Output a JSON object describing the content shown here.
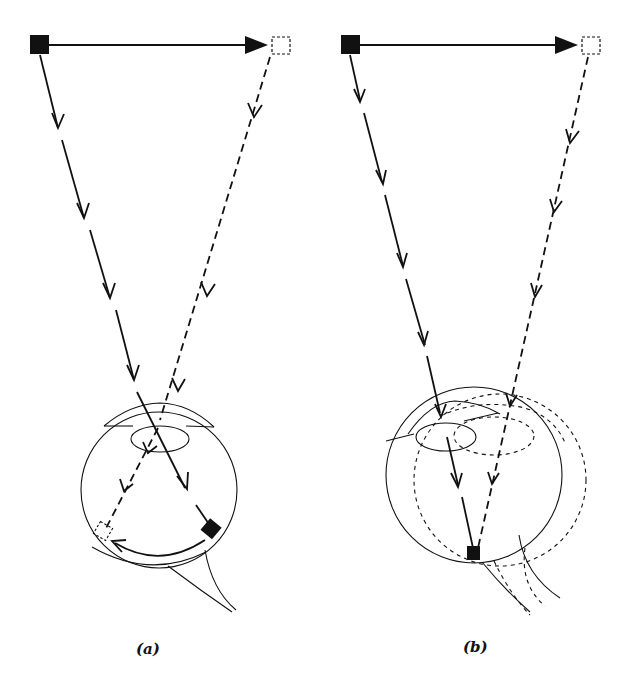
{
  "figure": {
    "panels": [
      {
        "id": "a",
        "label": "(a)",
        "description": "Object moves from left (solid square) to right (dashed square); stationary eye; image moves across retina from right to left (curved arrow)",
        "elements": {
          "object_start": "filled-square",
          "object_end": "dashed-square",
          "motion_arrow": "horizontal solid arrow left to right",
          "ray_from_start": "solid line with arrowheads into eye, lands on filled square on retina",
          "ray_from_end": "dashed line with arrowheads into eye, lands on dashed square on retina",
          "retinal_motion": "curved arrow along retina"
        }
      },
      {
        "id": "b",
        "label": "(b)",
        "description": "Object moves left to right; eye rotates to track it (dashed eye outline); image stays on same retinal location",
        "elements": {
          "object_start": "filled-square",
          "object_end": "dashed-square",
          "motion_arrow": "horizontal solid arrow left to right",
          "ray_from_start": "solid line with arrowheads into eye",
          "ray_from_end": "dashed line with arrowheads into rotated eye",
          "retinal_image": "single filled square on retina (fovea)",
          "rotated_eye": "dashed eye outline"
        }
      }
    ]
  },
  "colors": {
    "ink": "#111111",
    "background": "#ffffff"
  }
}
